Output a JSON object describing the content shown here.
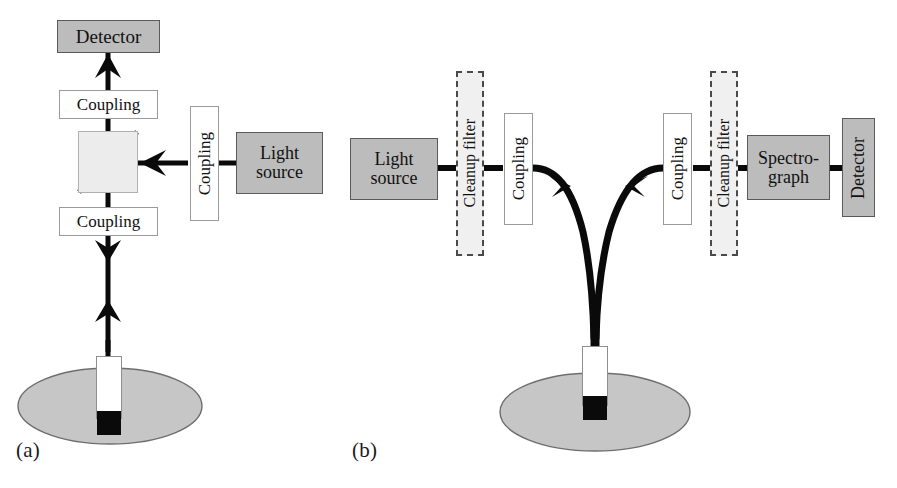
{
  "figure": {
    "type": "schematic-diagram",
    "panels": [
      {
        "id": "a",
        "label": "(a)",
        "components": [
          {
            "name": "detector",
            "label": "Detector",
            "style": "gray-box",
            "orientation": "horizontal"
          },
          {
            "name": "coupling-top",
            "label": "Coupling",
            "style": "white-box",
            "orientation": "horizontal"
          },
          {
            "name": "beamsplitter",
            "label": "",
            "style": "cube-with-diagonal",
            "orientation": "diagonal"
          },
          {
            "name": "coupling-bottom",
            "label": "Coupling",
            "style": "white-box",
            "orientation": "horizontal"
          },
          {
            "name": "coupling-source",
            "label": "Coupling",
            "style": "white-box",
            "orientation": "vertical"
          },
          {
            "name": "light-source",
            "label": "Light source",
            "label_lines": [
              "Light",
              "source"
            ],
            "style": "gray-box",
            "orientation": "horizontal"
          },
          {
            "name": "probe",
            "label": "",
            "style": "probe-with-black-tip",
            "orientation": "vertical"
          },
          {
            "name": "sample",
            "label": "",
            "style": "gray-ellipse",
            "orientation": "horizontal"
          }
        ],
        "beam_paths": [
          {
            "from": "light-source",
            "to": "beamsplitter",
            "direction": "leftward",
            "arrow": "left"
          },
          {
            "from": "beamsplitter",
            "to": "detector",
            "direction": "upward",
            "arrow": "up"
          },
          {
            "from": "beamsplitter",
            "to": "probe",
            "direction": "downward",
            "arrow": "down"
          },
          {
            "from": "probe",
            "to": "beamsplitter",
            "direction": "upward",
            "arrow": "up"
          }
        ]
      },
      {
        "id": "b",
        "label": "(b)",
        "components": [
          {
            "name": "light-source",
            "label": "Light source",
            "label_lines": [
              "Light",
              "source"
            ],
            "style": "gray-box",
            "orientation": "horizontal"
          },
          {
            "name": "cleanup-filter-excitation",
            "label": "Cleanup filter",
            "style": "dashed-box",
            "orientation": "vertical"
          },
          {
            "name": "coupling-excitation",
            "label": "Coupling",
            "style": "white-box",
            "orientation": "vertical"
          },
          {
            "name": "coupling-collection",
            "label": "Coupling",
            "style": "white-box",
            "orientation": "vertical"
          },
          {
            "name": "cleanup-filter-collection",
            "label": "Cleanup filter",
            "style": "dashed-box",
            "orientation": "vertical"
          },
          {
            "name": "spectrograph",
            "label": "Spectro-graph",
            "label_lines": [
              "Spectro-",
              "graph"
            ],
            "style": "gray-box",
            "orientation": "horizontal"
          },
          {
            "name": "detector",
            "label": "Detector",
            "style": "gray-box",
            "orientation": "vertical"
          },
          {
            "name": "fiber-probe",
            "label": "",
            "style": "probe-with-black-tip",
            "orientation": "vertical"
          },
          {
            "name": "sample",
            "label": "",
            "style": "gray-ellipse",
            "orientation": "horizontal"
          },
          {
            "name": "y-fiber-bundle",
            "label": "",
            "style": "bifurcated-fiber",
            "orientation": "y-shape"
          }
        ],
        "beam_paths": [
          {
            "from": "light-source",
            "to": "cleanup-filter-excitation",
            "direction": "rightward",
            "arrow": "none"
          },
          {
            "from": "cleanup-filter-excitation",
            "to": "coupling-excitation",
            "direction": "rightward",
            "arrow": "none"
          },
          {
            "from": "coupling-excitation",
            "to": "fiber-probe",
            "direction": "down-right-curve",
            "arrow": "down-right"
          },
          {
            "from": "fiber-probe",
            "to": "coupling-collection",
            "direction": "up-right-curve",
            "arrow": "up-right"
          },
          {
            "from": "coupling-collection",
            "to": "cleanup-filter-collection",
            "direction": "rightward",
            "arrow": "none"
          },
          {
            "from": "cleanup-filter-collection",
            "to": "spectrograph",
            "direction": "rightward",
            "arrow": "none"
          },
          {
            "from": "spectrograph",
            "to": "detector",
            "direction": "rightward",
            "arrow": "none"
          }
        ]
      }
    ]
  },
  "labels": {
    "detector": "Detector",
    "coupling": "Coupling",
    "light_source_line1": "Light",
    "light_source_line2": "source",
    "cleanup_filter": "Cleanup filter",
    "spectrograph_line1": "Spectro-",
    "spectrograph_line2": "graph",
    "panel_a": "(a)",
    "panel_b": "(b)"
  },
  "colors": {
    "background": "#ffffff",
    "gray_box_fill": "#bcbcbc",
    "gray_box_border": "#5a5a5a",
    "white_box_fill": "#ffffff",
    "white_box_border": "#9a9a9a",
    "dashed_box_fill": "#f0f0f0",
    "dashed_box_border": "#4a4a4a",
    "beam_line": "#0a0a0a",
    "sample_fill": "#c6c6c6",
    "sample_border": "#6e6e6e",
    "probe_tip": "#0a0a0a",
    "beamsplitter_fill": "#ececec",
    "text": "#111111"
  }
}
